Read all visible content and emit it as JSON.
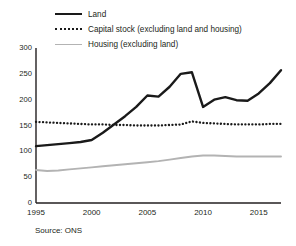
{
  "legend": {
    "position": "top-left",
    "items": [
      {
        "label": "Land",
        "key": "solid-black-line",
        "color": "#1a1a1a"
      },
      {
        "label": "Capital stock (excluding land and housing)",
        "key": "dotted-black-line",
        "color": "#1a1a1a"
      },
      {
        "label": "Housing (excluding land)",
        "key": "solid-grey-line",
        "color": "#b3b3b3"
      }
    ]
  },
  "axes": {
    "y_ticks": [
      "0",
      "50",
      "100",
      "150",
      "200",
      "250",
      "300"
    ],
    "x_ticks": [
      "1995",
      "2000",
      "2005",
      "2010",
      "2015"
    ]
  },
  "source": {
    "text": "Source: ONS"
  },
  "chart_data": {
    "type": "line",
    "title": "",
    "xlabel": "",
    "ylabel": "",
    "xlim": [
      1995,
      2017
    ],
    "ylim": [
      0,
      300
    ],
    "grid": false,
    "legend_position": "top-left",
    "x": [
      1995,
      1996,
      1997,
      1998,
      1999,
      2000,
      2001,
      2002,
      2003,
      2004,
      2005,
      2006,
      2007,
      2008,
      2009,
      2010,
      2011,
      2012,
      2013,
      2014,
      2015,
      2016,
      2017
    ],
    "series": [
      {
        "name": "Land",
        "color": "#1a1a1a",
        "style": "solid",
        "values": [
          110,
          112,
          114,
          116,
          118,
          122,
          136,
          152,
          168,
          186,
          208,
          206,
          225,
          250,
          253,
          186,
          200,
          205,
          199,
          198,
          212,
          232,
          257
        ]
      },
      {
        "name": "Capital stock (excluding land and housing)",
        "color": "#1a1a1a",
        "style": "dotted",
        "values": [
          157,
          156,
          155,
          154,
          153,
          152,
          152,
          151,
          151,
          150,
          150,
          150,
          151,
          152,
          158,
          155,
          154,
          153,
          152,
          152,
          152,
          153,
          153
        ]
      },
      {
        "name": "Housing (excluding land)",
        "color": "#b3b3b3",
        "style": "solid",
        "values": [
          64,
          62,
          63,
          65,
          67,
          69,
          71,
          73,
          75,
          77,
          79,
          81,
          84,
          87,
          90,
          92,
          92,
          91,
          90,
          90,
          90,
          90,
          90
        ]
      }
    ]
  }
}
